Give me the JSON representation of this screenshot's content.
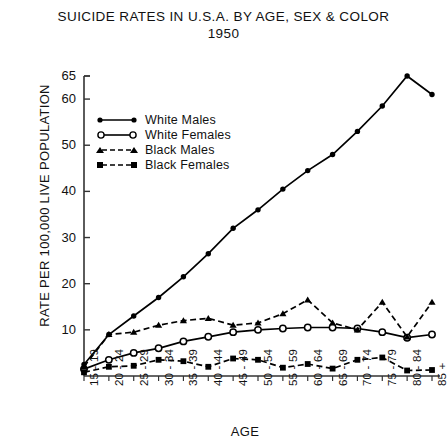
{
  "chart_data": {
    "type": "line",
    "title": "SUICIDE RATES IN U.S.A. BY AGE, SEX & COLOR",
    "subtitle": "1950",
    "xlabel": "AGE",
    "ylabel": "RATE PER 100,000 LIVE POPULATION",
    "categories": [
      "15 - 19",
      "20 - 24",
      "25 - 29",
      "30 - 34",
      "35 - 39",
      "40 - 44",
      "45 - 49",
      "50 - 54",
      "55 - 59",
      "60 - 64",
      "65 - 69",
      "70 - 74",
      "75 - 79",
      "80 - 84",
      "85 +"
    ],
    "ylim": [
      0,
      65
    ],
    "yticks": [
      10,
      20,
      30,
      40,
      50,
      60,
      65
    ],
    "grid": false,
    "legend_position": "upper-left-inside",
    "series": [
      {
        "name": "White Males",
        "marker": "filled-circle",
        "line": "solid",
        "values": [
          2.5,
          9.0,
          13.0,
          17.0,
          21.5,
          26.5,
          32.0,
          36.0,
          40.5,
          44.5,
          48.0,
          53.0,
          58.5,
          65.0,
          61.0
        ]
      },
      {
        "name": "White Females",
        "marker": "open-circle",
        "line": "solid",
        "values": [
          1.5,
          3.5,
          5.0,
          6.0,
          7.5,
          8.5,
          9.5,
          10.0,
          10.3,
          10.5,
          10.5,
          10.3,
          9.5,
          8.3,
          9.0
        ]
      },
      {
        "name": "Black Males",
        "marker": "filled-triangle",
        "line": "dashed",
        "values": [
          2.0,
          9.0,
          9.5,
          11.0,
          12.0,
          12.5,
          11.0,
          11.5,
          13.5,
          16.5,
          11.5,
          10.0,
          16.0,
          8.5,
          16.0
        ]
      },
      {
        "name": "Black Females",
        "marker": "filled-square",
        "line": "dashed",
        "values": [
          0.8,
          2.0,
          2.2,
          3.5,
          3.2,
          2.0,
          3.8,
          3.5,
          1.8,
          2.6,
          1.6,
          3.5,
          4.0,
          1.2,
          1.3
        ]
      }
    ]
  },
  "legend": {
    "items": [
      {
        "label": "White Males"
      },
      {
        "label": "White Females"
      },
      {
        "label": "Black Males"
      },
      {
        "label": "Black Females"
      }
    ]
  }
}
